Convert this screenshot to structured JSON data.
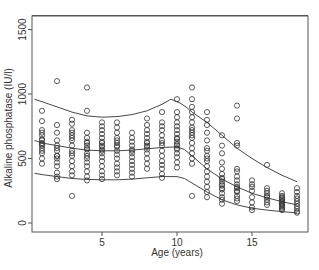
{
  "chart_data": {
    "type": "scatter",
    "title": "",
    "xlabel": "Age (years)",
    "ylabel": "Alkaline phosphatase (IU/l)",
    "xlim": [
      0,
      18.7
    ],
    "ylim": [
      -70,
      1600
    ],
    "x_ticks": [
      5,
      10,
      15
    ],
    "y_ticks": [
      0,
      500,
      1000,
      1500
    ],
    "grid": false,
    "legend": null,
    "series": [
      {
        "name": "observations",
        "kind": "points",
        "marker": "open-circle",
        "points": [
          [
            1,
            720
          ],
          [
            1,
            680
          ],
          [
            1,
            650
          ],
          [
            1,
            640
          ],
          [
            1,
            620
          ],
          [
            1,
            600
          ],
          [
            1,
            580
          ],
          [
            1,
            560
          ],
          [
            1,
            540
          ],
          [
            1,
            500
          ],
          [
            1,
            460
          ],
          [
            1,
            790
          ],
          [
            1,
            870
          ],
          [
            1,
            700
          ],
          [
            1,
            610
          ],
          [
            2,
            1100
          ],
          [
            2,
            760
          ],
          [
            2,
            700
          ],
          [
            2,
            640
          ],
          [
            2,
            600
          ],
          [
            2,
            560
          ],
          [
            2,
            520
          ],
          [
            2,
            500
          ],
          [
            2,
            470
          ],
          [
            2,
            440
          ],
          [
            2,
            390
          ],
          [
            2,
            360
          ],
          [
            2,
            340
          ],
          [
            2,
            520
          ],
          [
            2,
            580
          ],
          [
            3,
            800
          ],
          [
            3,
            770
          ],
          [
            3,
            720
          ],
          [
            3,
            680
          ],
          [
            3,
            640
          ],
          [
            3,
            600
          ],
          [
            3,
            560
          ],
          [
            3,
            520
          ],
          [
            3,
            480
          ],
          [
            3,
            440
          ],
          [
            3,
            400
          ],
          [
            3,
            370
          ],
          [
            3,
            210
          ],
          [
            3,
            660
          ],
          [
            3,
            700
          ],
          [
            3,
            540
          ],
          [
            4,
            1050
          ],
          [
            4,
            870
          ],
          [
            4,
            700
          ],
          [
            4,
            660
          ],
          [
            4,
            630
          ],
          [
            4,
            600
          ],
          [
            4,
            570
          ],
          [
            4,
            540
          ],
          [
            4,
            500
          ],
          [
            4,
            470
          ],
          [
            4,
            440
          ],
          [
            4,
            400
          ],
          [
            4,
            360
          ],
          [
            4,
            330
          ],
          [
            4,
            620
          ],
          [
            4,
            580
          ],
          [
            4,
            520
          ],
          [
            5,
            780
          ],
          [
            5,
            750
          ],
          [
            5,
            720
          ],
          [
            5,
            690
          ],
          [
            5,
            660
          ],
          [
            5,
            630
          ],
          [
            5,
            600
          ],
          [
            5,
            570
          ],
          [
            5,
            540
          ],
          [
            5,
            510
          ],
          [
            5,
            480
          ],
          [
            5,
            440
          ],
          [
            5,
            400
          ],
          [
            5,
            370
          ],
          [
            5,
            340
          ],
          [
            5,
            620
          ],
          [
            5,
            590
          ],
          [
            5,
            560
          ],
          [
            6,
            780
          ],
          [
            6,
            740
          ],
          [
            6,
            700
          ],
          [
            6,
            660
          ],
          [
            6,
            620
          ],
          [
            6,
            590
          ],
          [
            6,
            560
          ],
          [
            6,
            530
          ],
          [
            6,
            500
          ],
          [
            6,
            460
          ],
          [
            6,
            430
          ],
          [
            6,
            400
          ],
          [
            6,
            370
          ],
          [
            6,
            640
          ],
          [
            6,
            600
          ],
          [
            7,
            700
          ],
          [
            7,
            660
          ],
          [
            7,
            630
          ],
          [
            7,
            600
          ],
          [
            7,
            570
          ],
          [
            7,
            540
          ],
          [
            7,
            510
          ],
          [
            7,
            480
          ],
          [
            7,
            450
          ],
          [
            7,
            420
          ],
          [
            7,
            390
          ],
          [
            7,
            360
          ],
          [
            7,
            560
          ],
          [
            8,
            810
          ],
          [
            8,
            760
          ],
          [
            8,
            720
          ],
          [
            8,
            690
          ],
          [
            8,
            660
          ],
          [
            8,
            630
          ],
          [
            8,
            600
          ],
          [
            8,
            570
          ],
          [
            8,
            540
          ],
          [
            8,
            500
          ],
          [
            8,
            460
          ],
          [
            8,
            420
          ],
          [
            8,
            620
          ],
          [
            8,
            590
          ],
          [
            9,
            860
          ],
          [
            9,
            780
          ],
          [
            9,
            750
          ],
          [
            9,
            720
          ],
          [
            9,
            680
          ],
          [
            9,
            640
          ],
          [
            9,
            600
          ],
          [
            9,
            560
          ],
          [
            9,
            520
          ],
          [
            9,
            480
          ],
          [
            9,
            450
          ],
          [
            9,
            420
          ],
          [
            9,
            380
          ],
          [
            9,
            350
          ],
          [
            9,
            620
          ],
          [
            10,
            960
          ],
          [
            10,
            860
          ],
          [
            10,
            820
          ],
          [
            10,
            780
          ],
          [
            10,
            750
          ],
          [
            10,
            720
          ],
          [
            10,
            690
          ],
          [
            10,
            660
          ],
          [
            10,
            630
          ],
          [
            10,
            600
          ],
          [
            10,
            570
          ],
          [
            10,
            540
          ],
          [
            10,
            510
          ],
          [
            10,
            470
          ],
          [
            10,
            430
          ],
          [
            10,
            650
          ],
          [
            10,
            610
          ],
          [
            10,
            580
          ],
          [
            11,
            1050
          ],
          [
            11,
            960
          ],
          [
            11,
            900
          ],
          [
            11,
            860
          ],
          [
            11,
            820
          ],
          [
            11,
            780
          ],
          [
            11,
            740
          ],
          [
            11,
            700
          ],
          [
            11,
            660
          ],
          [
            11,
            620
          ],
          [
            11,
            580
          ],
          [
            11,
            540
          ],
          [
            11,
            500
          ],
          [
            11,
            460
          ],
          [
            11,
            720
          ],
          [
            11,
            680
          ],
          [
            11,
            210
          ],
          [
            12,
            860
          ],
          [
            12,
            800
          ],
          [
            12,
            760
          ],
          [
            12,
            700
          ],
          [
            12,
            640
          ],
          [
            12,
            580
          ],
          [
            12,
            520
          ],
          [
            12,
            480
          ],
          [
            12,
            440
          ],
          [
            12,
            400
          ],
          [
            12,
            360
          ],
          [
            12,
            320
          ],
          [
            12,
            280
          ],
          [
            12,
            240
          ],
          [
            12,
            200
          ],
          [
            12,
            560
          ],
          [
            12,
            500
          ],
          [
            13,
            680
          ],
          [
            13,
            600
          ],
          [
            13,
            540
          ],
          [
            13,
            470
          ],
          [
            13,
            420
          ],
          [
            13,
            380
          ],
          [
            13,
            350
          ],
          [
            13,
            320
          ],
          [
            13,
            290
          ],
          [
            13,
            260
          ],
          [
            13,
            230
          ],
          [
            13,
            200
          ],
          [
            13,
            180
          ],
          [
            13,
            150
          ],
          [
            13,
            340
          ],
          [
            13,
            300
          ],
          [
            13,
            270
          ],
          [
            14,
            910
          ],
          [
            14,
            810
          ],
          [
            14,
            620
          ],
          [
            14,
            600
          ],
          [
            14,
            420
          ],
          [
            14,
            400
          ],
          [
            14,
            360
          ],
          [
            14,
            330
          ],
          [
            14,
            300
          ],
          [
            14,
            270
          ],
          [
            14,
            240
          ],
          [
            14,
            210
          ],
          [
            14,
            190
          ],
          [
            14,
            170
          ],
          [
            14,
            280
          ],
          [
            14,
            250
          ],
          [
            15,
            330
          ],
          [
            15,
            300
          ],
          [
            15,
            280
          ],
          [
            15,
            250
          ],
          [
            15,
            200
          ],
          [
            15,
            160
          ],
          [
            15,
            120
          ],
          [
            15,
            100
          ],
          [
            16,
            450
          ],
          [
            16,
            270
          ],
          [
            16,
            250
          ],
          [
            16,
            230
          ],
          [
            16,
            200
          ],
          [
            16,
            180
          ],
          [
            16,
            160
          ],
          [
            16,
            140
          ],
          [
            16,
            210
          ],
          [
            17,
            230
          ],
          [
            17,
            210
          ],
          [
            17,
            200
          ],
          [
            17,
            190
          ],
          [
            17,
            180
          ],
          [
            17,
            170
          ],
          [
            17,
            160
          ],
          [
            17,
            150
          ],
          [
            17,
            140
          ],
          [
            17,
            130
          ],
          [
            17,
            120
          ],
          [
            17,
            110
          ],
          [
            17,
            100
          ],
          [
            18,
            270
          ],
          [
            18,
            240
          ],
          [
            18,
            210
          ],
          [
            18,
            190
          ],
          [
            18,
            170
          ],
          [
            18,
            150
          ],
          [
            18,
            130
          ],
          [
            18,
            110
          ],
          [
            18,
            90
          ],
          [
            18,
            80
          ]
        ]
      },
      {
        "name": "upper centile",
        "kind": "line",
        "points": [
          [
            0.5,
            960
          ],
          [
            1,
            940
          ],
          [
            2,
            900
          ],
          [
            3,
            860
          ],
          [
            4,
            830
          ],
          [
            5,
            820
          ],
          [
            6,
            825
          ],
          [
            7,
            840
          ],
          [
            8,
            870
          ],
          [
            9,
            920
          ],
          [
            9.6,
            960
          ],
          [
            10.2,
            930
          ],
          [
            10.6,
            900
          ],
          [
            11,
            860
          ],
          [
            12,
            780
          ],
          [
            13,
            680
          ],
          [
            14,
            580
          ],
          [
            15,
            500
          ],
          [
            16,
            430
          ],
          [
            17,
            370
          ],
          [
            18,
            320
          ]
        ]
      },
      {
        "name": "median",
        "kind": "line",
        "points": [
          [
            0.5,
            640
          ],
          [
            1,
            620
          ],
          [
            2,
            600
          ],
          [
            3,
            580
          ],
          [
            4,
            565
          ],
          [
            5,
            560
          ],
          [
            6,
            560
          ],
          [
            7,
            565
          ],
          [
            8,
            575
          ],
          [
            9,
            585
          ],
          [
            10,
            590
          ],
          [
            10.5,
            570
          ],
          [
            11,
            520
          ],
          [
            12,
            420
          ],
          [
            13,
            340
          ],
          [
            14,
            280
          ],
          [
            15,
            230
          ],
          [
            16,
            195
          ],
          [
            17,
            165
          ],
          [
            18,
            140
          ]
        ]
      },
      {
        "name": "lower centile",
        "kind": "line",
        "points": [
          [
            0.5,
            385
          ],
          [
            1,
            375
          ],
          [
            2,
            360
          ],
          [
            3,
            345
          ],
          [
            4,
            338
          ],
          [
            5,
            335
          ],
          [
            6,
            335
          ],
          [
            7,
            340
          ],
          [
            8,
            350
          ],
          [
            9,
            360
          ],
          [
            10,
            360
          ],
          [
            10.5,
            345
          ],
          [
            11,
            310
          ],
          [
            12,
            240
          ],
          [
            13,
            180
          ],
          [
            14,
            140
          ],
          [
            15,
            115
          ],
          [
            16,
            100
          ],
          [
            17,
            88
          ],
          [
            18,
            78
          ]
        ]
      }
    ]
  }
}
